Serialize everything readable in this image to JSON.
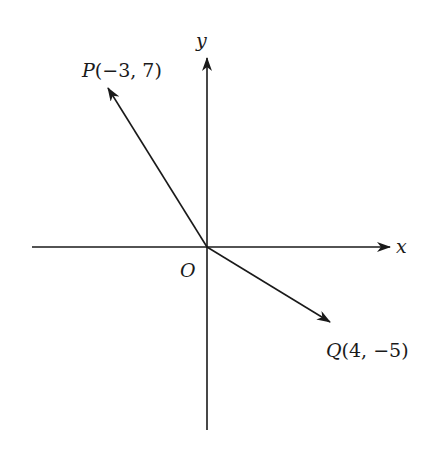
{
  "diagram": {
    "type": "coordinate-vectors",
    "axes": {
      "x_label": "x",
      "y_label": "y",
      "origin_label": "O"
    },
    "vectors": [
      {
        "name": "P",
        "coords": "(−3, 7)",
        "x": -3,
        "y": 7
      },
      {
        "name": "Q",
        "coords": "(4, −5)",
        "x": 4,
        "y": -5
      }
    ],
    "colors": {
      "line": "#1a1a1a",
      "background": "#ffffff"
    }
  }
}
